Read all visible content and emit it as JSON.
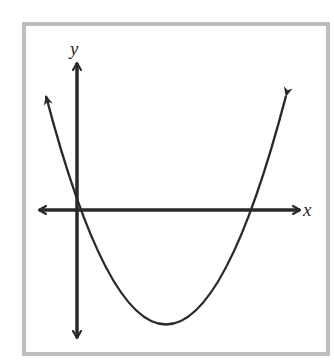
{
  "figure": {
    "type": "parabola-graph",
    "axes": {
      "x_label": "x",
      "y_label": "y"
    },
    "curve": {
      "shape": "parabola",
      "opens": "up",
      "roots": [
        "at origin",
        "positive x-axis"
      ],
      "vertex_quadrant": "IV",
      "arrowheads": "both ends"
    },
    "colors": {
      "frame_border": "#bdbdbd",
      "ink": "#2a2a2a",
      "background": "#ffffff"
    }
  }
}
